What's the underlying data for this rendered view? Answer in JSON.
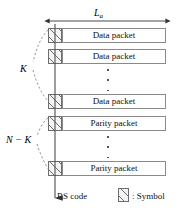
{
  "figure": {
    "type": "block-diagram",
    "background_color": "#ffffff",
    "line_color": "#4d4d4d",
    "box_border_color": "#8a8a8a",
    "hatch_color": "#6d6d6d"
  },
  "dimension": {
    "label_base": "L",
    "label_sub": "a",
    "arrow_style": "double-headed-horizontal"
  },
  "rows": [
    {
      "label": "Data packet",
      "kind": "data"
    },
    {
      "label": "Data packet",
      "kind": "data"
    },
    {
      "label": "Data packet",
      "kind": "data"
    },
    {
      "label": "Parity packet",
      "kind": "parity"
    },
    {
      "label": "Parity packet",
      "kind": "parity"
    }
  ],
  "ellipsis": {
    "glyph": "vertical-dots",
    "dot_count": 3
  },
  "braces": [
    {
      "label": "K",
      "covers": "data-packets"
    },
    {
      "label": "N − K",
      "covers": "parity-packets"
    }
  ],
  "codeword": {
    "label": "RS code",
    "arrow_direction": "down"
  },
  "legend": {
    "swatch": "hatched-box",
    "label": ": Symbol"
  }
}
